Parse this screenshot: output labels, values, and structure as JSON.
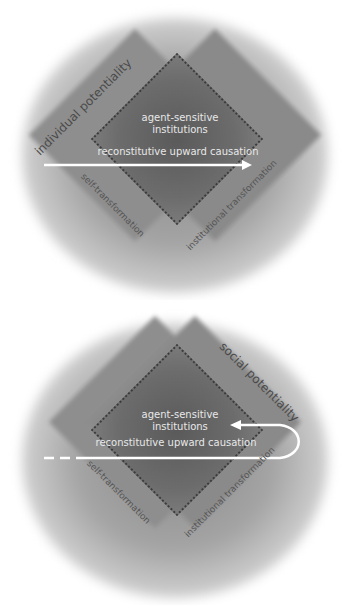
{
  "top_diagram": {
    "outer_label": "individual potentiality",
    "center_label_line1": "agent-sensitive",
    "center_label_line2": "institutions",
    "arrow_label": "reconstitutive upward causation",
    "bottom_left_label": "self-transformation",
    "bottom_right_label": "institutional transformation"
  },
  "bottom_diagram": {
    "outer_label": "social potentiality",
    "center_label_line1": "agent-sensitive",
    "center_label_line2": "institutions",
    "arrow_label": "reconstitutive upward causation",
    "bottom_left_label": "self-transformation",
    "bottom_right_label": "institutional transformation"
  },
  "colors": {
    "halo": "#a4a4a4",
    "square": "#8c8c8c",
    "core": "#5f5f5f",
    "arrow": "#ffffff",
    "text_light": "#e8e8e8",
    "text_dark": "#4a4a4a"
  }
}
